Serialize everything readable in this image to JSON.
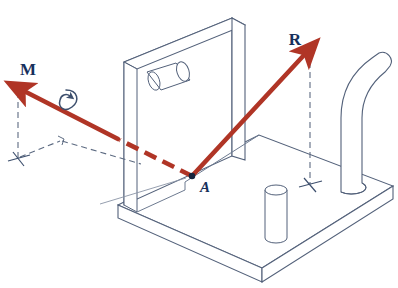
{
  "figure": {
    "background_color": "#ffffff",
    "width": 398,
    "height": 288
  },
  "palette": {
    "vector_red": "#b03526",
    "vector_red_dark": "#9e2f22",
    "outline_navy": "#4a5a73",
    "outline_light": "#7b879b",
    "construction_dash": "#5d6b82",
    "label_navy": "#17305c"
  },
  "labels": {
    "moment_vector": "M",
    "resultant_vector": "R",
    "point": "A"
  },
  "vectors": [
    {
      "name": "moment-vector",
      "label": "M",
      "color": "#b03526",
      "style": "double-headed-curl",
      "from": {
        "x": 192,
        "y": 176
      },
      "to": {
        "x": 18,
        "y": 88
      },
      "label_pos": {
        "x": 28,
        "y": 72
      },
      "has_arrowhead": true,
      "hidden_segment": true,
      "curl_symbol": "moment-curl-arrow"
    },
    {
      "name": "resultant-vector",
      "label": "R",
      "color": "#b03526",
      "style": "solid",
      "from": {
        "x": 192,
        "y": 176
      },
      "to": {
        "x": 310,
        "y": 48
      },
      "label_pos": {
        "x": 293,
        "y": 42
      },
      "has_arrowhead": true,
      "hidden_segment": false
    }
  ],
  "point_markers": [
    {
      "name": "point-a-marker",
      "label": "A",
      "x": 192,
      "y": 176,
      "label_pos": {
        "x": 198,
        "y": 190
      }
    }
  ],
  "construction_lines": [
    {
      "name": "moment-vertical-drop",
      "from": {
        "x": 18,
        "y": 90
      },
      "to": {
        "x": 18,
        "y": 160
      }
    },
    {
      "name": "moment-horizontal-trace",
      "from": {
        "x": 18,
        "y": 158
      },
      "to": {
        "x": 62,
        "y": 140
      }
    },
    {
      "name": "moment-depth-trace",
      "from": {
        "x": 62,
        "y": 140
      },
      "to": {
        "x": 140,
        "y": 163
      }
    },
    {
      "name": "resultant-vertical-drop",
      "from": {
        "x": 310,
        "y": 50
      },
      "to": {
        "x": 310,
        "y": 186
      }
    }
  ],
  "tick_markers": [
    {
      "name": "tick-marker-left",
      "x": 18,
      "y": 160
    },
    {
      "name": "tick-marker-right",
      "x": 310,
      "y": 186
    }
  ],
  "solid_parts": [
    {
      "name": "base-plate",
      "kind": "plate"
    },
    {
      "name": "vertical-plate",
      "kind": "plate"
    },
    {
      "name": "horizontal-pin",
      "kind": "cylinder"
    },
    {
      "name": "short-post",
      "kind": "cylinder"
    },
    {
      "name": "bent-rod",
      "kind": "rod"
    }
  ]
}
